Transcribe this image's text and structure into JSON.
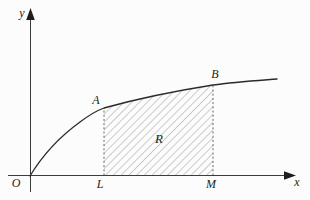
{
  "figure": {
    "type": "math-diagram",
    "colors": {
      "background": "#fcfcfc",
      "axis": "#3c3c3c",
      "curve": "#2b2b2b",
      "dashed_line": "#555555",
      "hatch": "#9a9a9a",
      "label_text": "#1d1d1d"
    },
    "labels": {
      "y_axis": "y",
      "x_axis": "x",
      "origin": "O",
      "left_foot": "L",
      "right_foot": "M",
      "point_a": "A",
      "point_b": "B",
      "region": "R"
    },
    "geometry": {
      "x_axis_path": "M8,175.5 H291",
      "y_axis_path": "M30.5,192 V15",
      "x_arrow_points": "296,175.5 284,171.2 284,179.8",
      "y_arrow_points": "30.5,8 26.2,20 34.8,20",
      "curve_path": "M30,176 C42,156 58,138 80,122 C90,114.5 97,110.5 104,108 C140,98 175,91 213,85 C235,82 258,80.5 277,79",
      "region_path": "M104,175.5 L104,108 C140,98 175,91 213,85 L213,175.5 Z",
      "left_dashed_path": "M104,175.5 V108",
      "right_dashed_path": "M213,175.5 V85"
    }
  }
}
